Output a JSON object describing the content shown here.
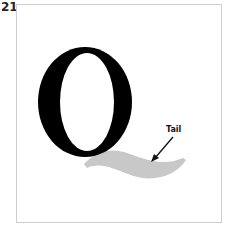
{
  "figure": {
    "number": "21",
    "letter": "Q",
    "annotation": "Tail",
    "colors": {
      "letter": "#000000",
      "tail": "#c8c8c8",
      "frame": "#cfcfcf",
      "arrow": "#111111"
    }
  }
}
